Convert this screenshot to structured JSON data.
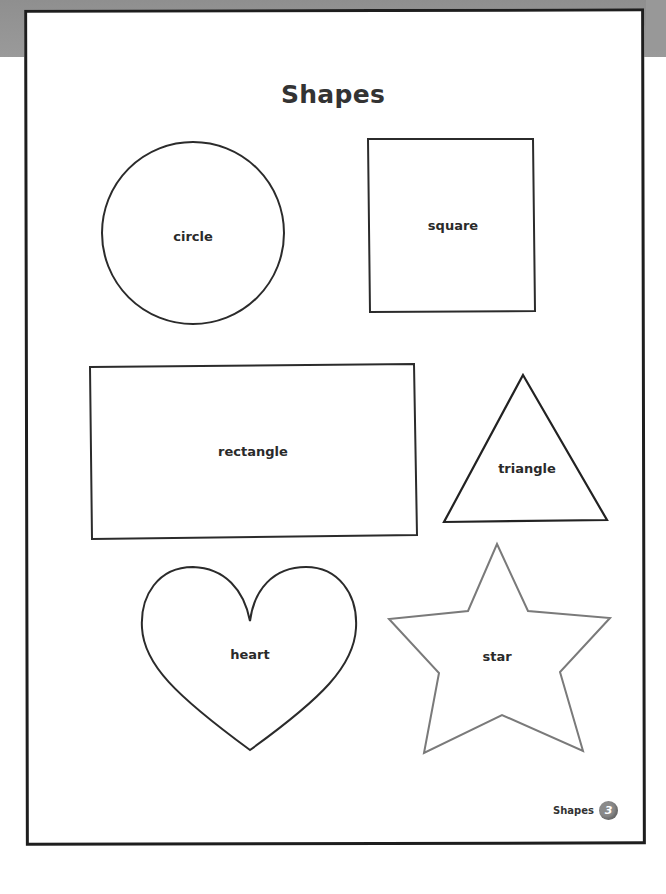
{
  "page": {
    "title": "Shapes",
    "footer": {
      "label": "Shapes",
      "page_number": "3"
    }
  },
  "shapes": [
    {
      "name": "circle",
      "label": "circle"
    },
    {
      "name": "square",
      "label": "square"
    },
    {
      "name": "rectangle",
      "label": "rectangle"
    },
    {
      "name": "triangle",
      "label": "triangle"
    },
    {
      "name": "heart",
      "label": "heart"
    },
    {
      "name": "star",
      "label": "star"
    }
  ],
  "colors": {
    "outline": "#2b2b2b",
    "star_outline": "#7a7a7a",
    "scan_band": "#949494",
    "badge": "#8a8a8a"
  }
}
